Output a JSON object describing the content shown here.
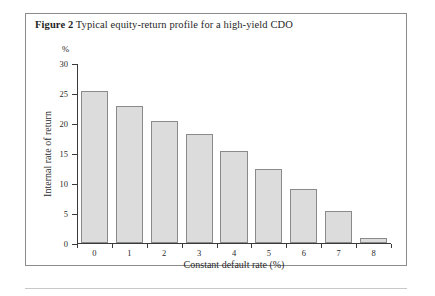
{
  "figure": {
    "label": "Figure 2",
    "caption": "Typical equity-return profile for a high-yield CDO",
    "unit_label": "%"
  },
  "chart_data": {
    "type": "bar",
    "title": "Typical equity-return profile for a high-yield CDO",
    "categories": [
      "0",
      "1",
      "2",
      "3",
      "4",
      "5",
      "6",
      "7",
      "8"
    ],
    "values": [
      25.3,
      22.8,
      20.3,
      18.2,
      15.4,
      12.4,
      9.0,
      5.3,
      0.9
    ],
    "xlabel": "Constant default rate (%)",
    "ylabel": "Internal rate of return",
    "yunit": "%",
    "ylim": [
      0,
      30
    ],
    "yticks": [
      0,
      5,
      10,
      15,
      20,
      25,
      30
    ],
    "ytick_labels": [
      "0",
      "5",
      "10",
      "15",
      "20",
      "25",
      "30"
    ],
    "grid": false,
    "legend": false,
    "bar_fill": "#dcdcdc",
    "bar_stroke": "#8a8a8a"
  }
}
